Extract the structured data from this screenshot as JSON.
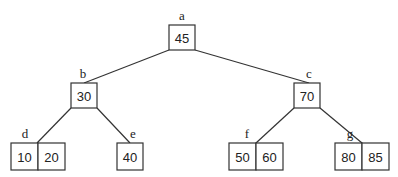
{
  "diagram": {
    "type": "b-tree",
    "nodes": [
      {
        "id": "a",
        "label": "a",
        "keys": [
          "45"
        ],
        "x": 169,
        "y": 25,
        "w": 26,
        "h": 25,
        "lx": 182,
        "ly": 20
      },
      {
        "id": "b",
        "label": "b",
        "keys": [
          "30"
        ],
        "x": 71,
        "y": 83,
        "w": 26,
        "h": 25,
        "lx": 83,
        "ly": 78
      },
      {
        "id": "c",
        "label": "c",
        "keys": [
          "70"
        ],
        "x": 294,
        "y": 83,
        "w": 26,
        "h": 25,
        "lx": 309,
        "ly": 78
      },
      {
        "id": "d",
        "label": "d",
        "keys": [
          "10",
          "20"
        ],
        "x": 11,
        "y": 143,
        "w": 54,
        "h": 27,
        "lx": 25,
        "ly": 138
      },
      {
        "id": "e",
        "label": "e",
        "keys": [
          "40"
        ],
        "x": 117,
        "y": 143,
        "w": 26,
        "h": 27,
        "lx": 133,
        "ly": 138
      },
      {
        "id": "f",
        "label": "f",
        "keys": [
          "50",
          "60"
        ],
        "x": 229,
        "y": 143,
        "w": 54,
        "h": 27,
        "lx": 247,
        "ly": 138
      },
      {
        "id": "g",
        "label": "g",
        "keys": [
          "80",
          "85"
        ],
        "x": 335,
        "y": 143,
        "w": 54,
        "h": 27,
        "lx": 350,
        "ly": 138
      }
    ],
    "edges": [
      {
        "from": "a",
        "to": "b",
        "x1": 169,
        "y1": 50,
        "x2": 84,
        "y2": 83
      },
      {
        "from": "a",
        "to": "c",
        "x1": 195,
        "y1": 50,
        "x2": 309,
        "y2": 83
      },
      {
        "from": "b",
        "to": "d",
        "x1": 71,
        "y1": 108,
        "x2": 37,
        "y2": 143
      },
      {
        "from": "b",
        "to": "e",
        "x1": 97,
        "y1": 108,
        "x2": 130,
        "y2": 143
      },
      {
        "from": "c",
        "to": "f",
        "x1": 294,
        "y1": 108,
        "x2": 256,
        "y2": 143
      },
      {
        "from": "c",
        "to": "g",
        "x1": 320,
        "y1": 108,
        "x2": 362,
        "y2": 143
      }
    ]
  }
}
